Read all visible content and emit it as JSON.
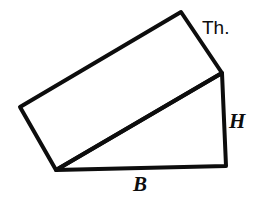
{
  "figure": {
    "canvas": {
      "width": 260,
      "height": 202
    },
    "background_color": "#ffffff",
    "stroke_color": "#0d0d0d",
    "fill_color": "#ffffff",
    "stroke_width": 4,
    "vertices": {
      "apex_top": {
        "x": 181,
        "y": 12
      },
      "left_corner": {
        "x": 20,
        "y": 107
      },
      "bottom_left": {
        "x": 56,
        "y": 170
      },
      "bottom_right": {
        "x": 226,
        "y": 166
      },
      "incline_top_right": {
        "x": 222,
        "y": 73
      }
    },
    "shapes": [
      {
        "name": "slab",
        "type": "parallelogram",
        "points": "20,107 181,12 222,73 56,170"
      },
      {
        "name": "wedge",
        "type": "right-triangle",
        "points": "56,170 222,73 226,166"
      }
    ]
  },
  "labels": {
    "thickness": {
      "text": "Th.",
      "x": 202,
      "y": 18,
      "style": "sans",
      "describes": "slab thickness edge"
    },
    "height": {
      "text": "H",
      "x": 229,
      "y": 111,
      "style": "serif-italic",
      "describes": "vertical height of wedge"
    },
    "base": {
      "text": "B",
      "x": 133,
      "y": 174,
      "style": "serif-italic",
      "describes": "horizontal base of wedge"
    }
  }
}
